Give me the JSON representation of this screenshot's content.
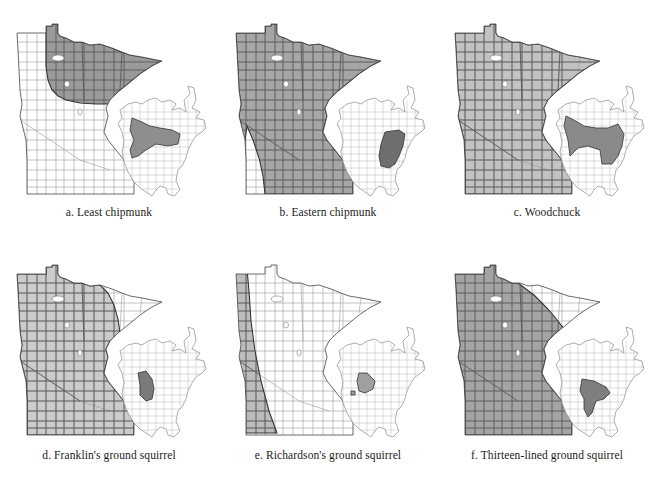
{
  "figure": {
    "panels": [
      {
        "id": "a",
        "caption": "a. Least chipmunk",
        "mn_range": "northeast",
        "mn_fill": "#9a9a9a",
        "na_range": "boreal-west",
        "na_fill": "#8e8e8e"
      },
      {
        "id": "b",
        "caption": "b. Eastern chipmunk",
        "mn_range": "all-but-sw",
        "mn_fill": "#a6a6a6",
        "na_range": "east",
        "na_fill": "#6e6e6e"
      },
      {
        "id": "c",
        "caption": "c. Woodchuck",
        "mn_range": "all",
        "mn_fill": "#c2c2c2",
        "na_range": "east-boreal",
        "na_fill": "#8a8a8a"
      },
      {
        "id": "d",
        "caption": "d. Franklin's ground squirrel",
        "mn_range": "all-but-arrowhead",
        "mn_fill": "#cbcbcb",
        "na_range": "plains-north",
        "na_fill": "#7a7a7a"
      },
      {
        "id": "e",
        "caption": "e. Richardson's ground squirrel",
        "mn_range": "west-strip",
        "mn_fill": "#bdbdbd",
        "na_range": "plains-nw",
        "na_fill": "#a0a0a0"
      },
      {
        "id": "f",
        "caption": "f. Thirteen-lined ground squirrel",
        "mn_range": "all-but-arrowhead-ne",
        "mn_fill": "#a4a4a4",
        "na_range": "plains-central",
        "na_fill": "#7e7e7e"
      }
    ],
    "colors": {
      "unshaded_fill": "#ffffff",
      "county_line": "#5a5a5a",
      "light_county_line": "#9a9a9a",
      "outline": "#444444",
      "lake": "#ffffff"
    }
  }
}
